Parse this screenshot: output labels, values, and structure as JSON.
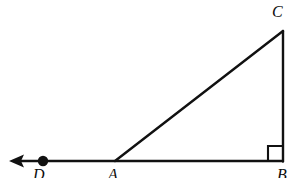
{
  "figure": {
    "background_color": "#ffffff",
    "stroke_color": "#111111",
    "labels": {
      "C": "C",
      "B": "B",
      "A": "A",
      "D": "D"
    },
    "points": {
      "C": {
        "x": 283,
        "y": 31
      },
      "B": {
        "x": 283,
        "y": 161
      },
      "A": {
        "x": 115,
        "y": 161
      },
      "D": {
        "x": 43,
        "y": 161
      },
      "arrow_tip": {
        "x": 11,
        "y": 161
      }
    },
    "segments": [
      {
        "name": "hypotenuse-AC",
        "from": "A",
        "to": "C"
      },
      {
        "name": "vertical-leg-BC",
        "from": "B",
        "to": "C"
      },
      {
        "name": "base-ray-BD",
        "from": "B",
        "to": "arrow_tip"
      }
    ],
    "right_angle": {
      "at": "B",
      "size": 15
    },
    "point_marker": {
      "at": "D",
      "radius": 5
    },
    "arrow": {
      "direction": "left",
      "at": "arrow_tip"
    }
  }
}
